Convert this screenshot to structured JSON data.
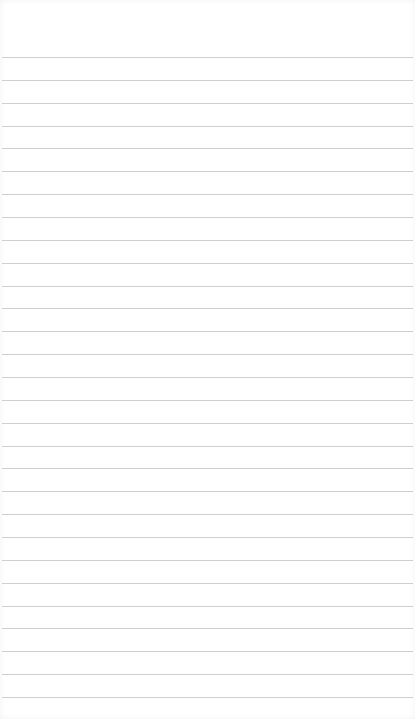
{
  "notepad": {
    "title": "",
    "content": "",
    "line_count": 29,
    "first_line_y": 57,
    "line_spacing": 22.857,
    "colors": {
      "paper": "#ffffff",
      "rule": "#cfcfcf"
    }
  }
}
